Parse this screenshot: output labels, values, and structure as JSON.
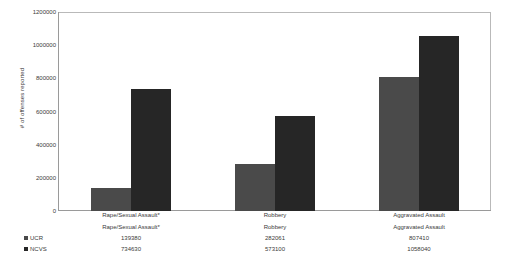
{
  "chart_data": {
    "type": "bar",
    "title": "",
    "subtitle": "",
    "xlabel": "",
    "ylabel": "# of offenses reported",
    "ylim": [
      0,
      1200000
    ],
    "ytick_labels": [
      "1200000",
      "1000000",
      "800000",
      "600000",
      "400000",
      "200000",
      "0"
    ],
    "ytick_values": [
      1200000,
      1000000,
      800000,
      600000,
      400000,
      200000,
      0
    ],
    "grid": false,
    "legend_position": "bottom-left",
    "categories": [
      "Rape/Sexual Assault*",
      "Robbery",
      "Aggravated Assault"
    ],
    "series": [
      {
        "name": "UCR",
        "color": "#4a4a4a",
        "values": [
          139380,
          282061,
          807410
        ],
        "value_labels": [
          "139380",
          "282061",
          "807410"
        ]
      },
      {
        "name": "NCVS",
        "color": "#262626",
        "values": [
          734630,
          573100,
          1058040
        ],
        "value_labels": [
          "734630",
          "573100",
          "1058040"
        ]
      }
    ],
    "annotations": [
      "*"
    ]
  },
  "colors": {
    "plot_background": "#ffffff",
    "axis_line": "#9a9a9a",
    "frame_line": "#b9b9b9",
    "text": "#3a3a3a",
    "series_ucr": "#4a4a4a",
    "series_ncvs": "#262626"
  }
}
